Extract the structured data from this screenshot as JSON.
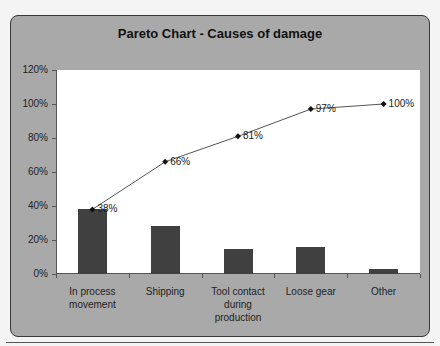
{
  "chart_data": {
    "type": "bar",
    "title": "Pareto Chart - Causes of damage",
    "xlabel": "",
    "ylabel": "",
    "ylim": [
      0,
      120
    ],
    "yticks": [
      "0%",
      "20%",
      "40%",
      "60%",
      "80%",
      "100%",
      "120%"
    ],
    "categories": [
      "In process movement",
      "Shipping",
      "Tool contact during production",
      "Loose gear",
      "Other"
    ],
    "category_label_lines": [
      [
        "In process",
        "movement"
      ],
      [
        "Shipping"
      ],
      [
        "Tool contact",
        "during",
        "production"
      ],
      [
        "Loose gear"
      ],
      [
        "Other"
      ]
    ],
    "series": [
      {
        "name": "Percent of damage",
        "type": "bar",
        "values": [
          38,
          28,
          15,
          16,
          3
        ]
      },
      {
        "name": "Cumulative percent",
        "type": "line",
        "values": [
          38,
          66,
          81,
          97,
          100
        ],
        "labels": [
          "38%",
          "66%",
          "81%",
          "97%",
          "100%"
        ]
      }
    ],
    "grid": false,
    "legend": "none"
  }
}
